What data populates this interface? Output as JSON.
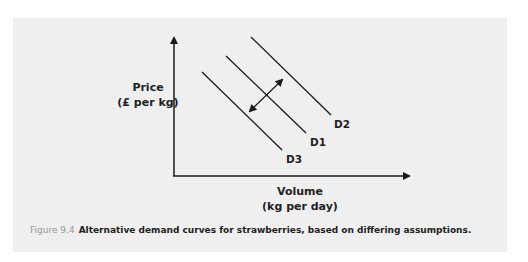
{
  "diagram": {
    "type": "demand-curves",
    "y_axis": {
      "line1": "Price",
      "line2": "(£ per kg)"
    },
    "x_axis": {
      "line1": "Volume",
      "line2": "(kg per day)"
    },
    "curves": [
      {
        "name": "D3",
        "label": "D3"
      },
      {
        "name": "D1",
        "label": "D1"
      },
      {
        "name": "D2",
        "label": "D2"
      }
    ],
    "shift_arrow": "double-headed arrow between D3 and D2 through D1",
    "colors": {
      "background": "#efefef",
      "line": "#1a1a1a",
      "caption_number": "#999999"
    }
  },
  "caption": {
    "number": "Figure 9.4",
    "text": "Alternative demand curves for strawberries, based on differing assumptions."
  }
}
